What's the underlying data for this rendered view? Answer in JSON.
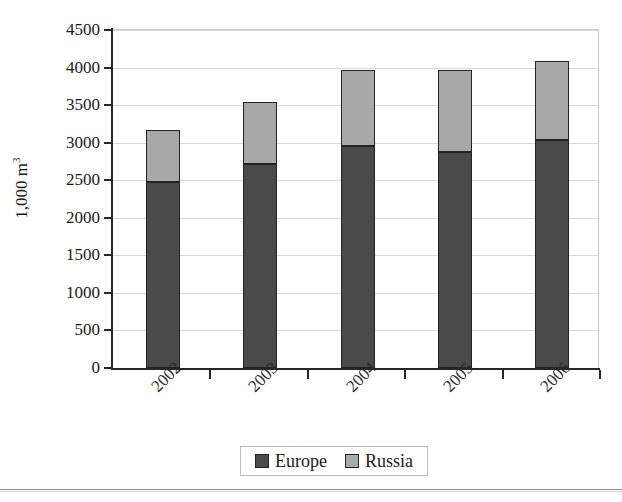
{
  "chart_data": {
    "type": "bar",
    "subtype": "stacked-vertical",
    "title": "",
    "xlabel": "",
    "ylabel": "1,000 m",
    "ylabel_superscript": "3",
    "categories": [
      "2002",
      "2003",
      "2004",
      "2005",
      "2006"
    ],
    "series": [
      {
        "name": "Europe",
        "color": "#4a4a4a",
        "values": [
          2470,
          2715,
          2960,
          2870,
          3040
        ]
      },
      {
        "name": "Russia",
        "color": "#a8a8a8",
        "values": [
          695,
          825,
          1005,
          1095,
          1050
        ]
      }
    ],
    "totals": [
      3165,
      3540,
      3965,
      3965,
      4090
    ],
    "ylim": [
      0,
      4500
    ],
    "ytick_values": [
      0,
      500,
      1000,
      1500,
      2000,
      2500,
      3000,
      3500,
      4000,
      4500
    ],
    "ytick_labels": [
      "0",
      "500",
      "1000",
      "1500",
      "2000",
      "2500",
      "3000",
      "3500",
      "4000",
      "4500"
    ],
    "grid": true,
    "grid_axis": "y",
    "legend_position": "bottom-center",
    "xtick_rotation": -45
  },
  "legend": {
    "items": [
      {
        "label": "Europe",
        "swatch": "europe-swatch-icon",
        "color": "#4a4a4a"
      },
      {
        "label": "Russia",
        "swatch": "russia-swatch-icon",
        "color": "#a8a8a8"
      }
    ]
  },
  "colors": {
    "europe": "#4a4a4a",
    "russia": "#a8a8a8",
    "axis": "#272727",
    "grid": "#d9d9d9",
    "frame": "#c9c9c9",
    "background": "#ffffff"
  }
}
